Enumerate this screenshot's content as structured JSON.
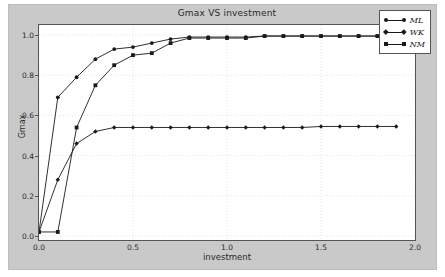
{
  "chart_data": {
    "type": "line",
    "title": "Gmax VS investment",
    "xlabel": "investment",
    "ylabel": "Gmax",
    "xlim": [
      0.0,
      2.0
    ],
    "ylim": [
      -0.02,
      1.05
    ],
    "xticks": [
      "0.0",
      "0.5",
      "1.0",
      "1.5",
      "2.0"
    ],
    "xtick_values": [
      0.0,
      0.5,
      1.0,
      1.5,
      2.0
    ],
    "yticks": [
      "0.0",
      "0.2",
      "0.4",
      "0.6",
      "0.8",
      "1.0"
    ],
    "ytick_values": [
      0.0,
      0.2,
      0.4,
      0.6,
      0.8,
      1.0
    ],
    "grid": true,
    "legend_position": "upper right",
    "series": [
      {
        "name": "ML",
        "marker": "circle",
        "color": "#1a1a1a",
        "x": [
          0.0,
          0.1,
          0.2,
          0.3,
          0.4,
          0.5,
          0.6,
          0.7,
          0.8,
          0.9,
          1.0,
          1.1,
          1.2,
          1.3,
          1.4,
          1.5,
          1.6,
          1.7,
          1.8,
          1.9
        ],
        "y": [
          0.02,
          0.69,
          0.79,
          0.88,
          0.93,
          0.94,
          0.96,
          0.98,
          0.99,
          0.99,
          0.99,
          0.99,
          0.995,
          0.995,
          0.995,
          0.995,
          0.995,
          0.995,
          0.995,
          0.995
        ]
      },
      {
        "name": "WK",
        "marker": "diamond",
        "color": "#1a1a1a",
        "x": [
          0.0,
          0.1,
          0.2,
          0.3,
          0.4,
          0.5,
          0.6,
          0.7,
          0.8,
          0.9,
          1.0,
          1.1,
          1.2,
          1.3,
          1.4,
          1.5,
          1.6,
          1.7,
          1.8,
          1.9
        ],
        "y": [
          0.02,
          0.28,
          0.46,
          0.52,
          0.54,
          0.54,
          0.54,
          0.54,
          0.54,
          0.54,
          0.54,
          0.54,
          0.54,
          0.54,
          0.54,
          0.545,
          0.545,
          0.545,
          0.545,
          0.545
        ]
      },
      {
        "name": "NM",
        "marker": "square",
        "color": "#1a1a1a",
        "x": [
          0.0,
          0.1,
          0.2,
          0.3,
          0.4,
          0.5,
          0.6,
          0.7,
          0.8,
          0.9,
          1.0,
          1.1,
          1.2,
          1.3,
          1.4,
          1.5,
          1.6,
          1.7,
          1.8,
          1.9
        ],
        "y": [
          0.02,
          0.02,
          0.54,
          0.75,
          0.85,
          0.9,
          0.91,
          0.96,
          0.985,
          0.985,
          0.985,
          0.985,
          0.995,
          0.995,
          0.995,
          0.995,
          0.995,
          0.995,
          0.995,
          0.995
        ]
      }
    ],
    "legend": [
      {
        "label": "ML",
        "marker": "circle"
      },
      {
        "label": "WK",
        "marker": "diamond"
      },
      {
        "label": "NM",
        "marker": "square"
      }
    ]
  }
}
